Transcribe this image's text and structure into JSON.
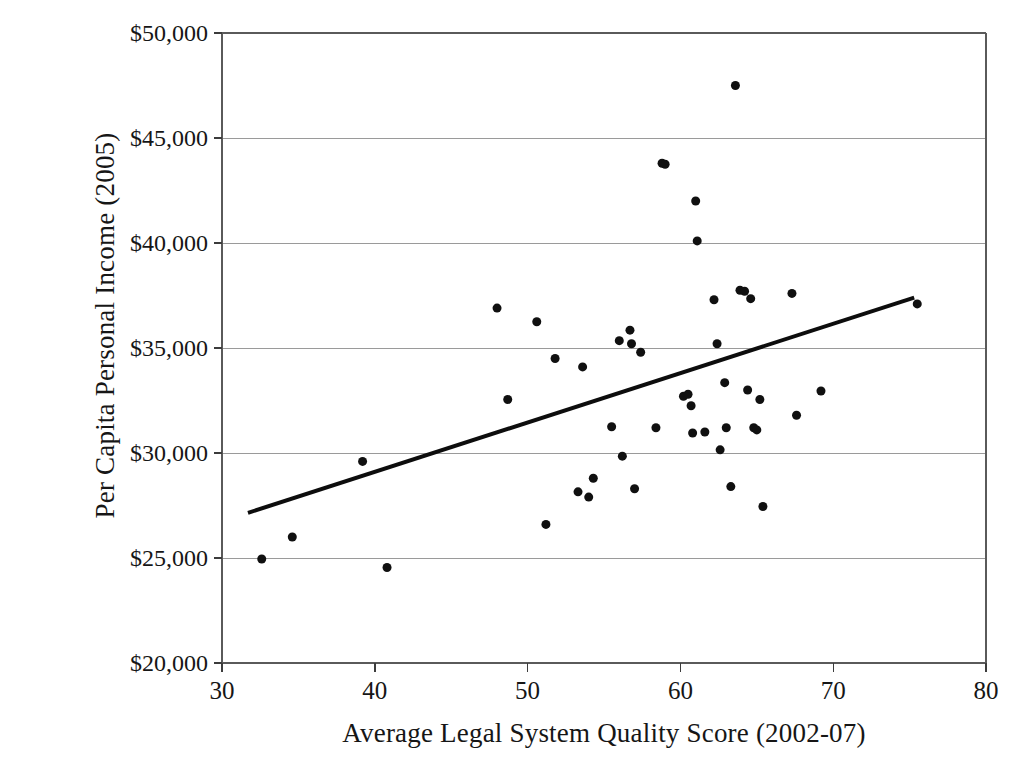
{
  "chart_data": {
    "type": "scatter",
    "title": "",
    "xlabel": "Average Legal System Quality Score (2002-07)",
    "ylabel": "Per Capita Personal Income (2005)",
    "xlim": [
      30,
      80
    ],
    "ylim": [
      20000,
      50000
    ],
    "xticks": [
      30,
      40,
      50,
      60,
      70,
      80
    ],
    "xtick_labels": [
      "30",
      "40",
      "50",
      "60",
      "70",
      "80"
    ],
    "yticks": [
      20000,
      25000,
      30000,
      35000,
      40000,
      45000,
      50000
    ],
    "ytick_labels": [
      "$20,000",
      "$25,000",
      "$30,000",
      "$35,000",
      "$40,000",
      "$45,000",
      "$50,000"
    ],
    "grid": "horizontal",
    "legend": "none",
    "marker": {
      "shape": "circle",
      "color": "#101010",
      "size": 9
    },
    "points": [
      {
        "x": 32.6,
        "y": 24950
      },
      {
        "x": 34.6,
        "y": 26000
      },
      {
        "x": 39.2,
        "y": 29600
      },
      {
        "x": 40.8,
        "y": 24550
      },
      {
        "x": 48.0,
        "y": 36900
      },
      {
        "x": 48.7,
        "y": 32550
      },
      {
        "x": 50.6,
        "y": 36250
      },
      {
        "x": 51.2,
        "y": 26600
      },
      {
        "x": 51.8,
        "y": 34500
      },
      {
        "x": 53.3,
        "y": 28150
      },
      {
        "x": 53.6,
        "y": 34100
      },
      {
        "x": 54.0,
        "y": 27900
      },
      {
        "x": 54.3,
        "y": 28800
      },
      {
        "x": 55.5,
        "y": 31250
      },
      {
        "x": 56.0,
        "y": 35350
      },
      {
        "x": 56.2,
        "y": 29850
      },
      {
        "x": 56.7,
        "y": 35850
      },
      {
        "x": 56.8,
        "y": 35200
      },
      {
        "x": 57.0,
        "y": 28300
      },
      {
        "x": 57.4,
        "y": 34800
      },
      {
        "x": 58.4,
        "y": 31200
      },
      {
        "x": 58.8,
        "y": 43800
      },
      {
        "x": 59.0,
        "y": 43750
      },
      {
        "x": 60.2,
        "y": 32700
      },
      {
        "x": 60.5,
        "y": 32800
      },
      {
        "x": 60.7,
        "y": 32250
      },
      {
        "x": 60.8,
        "y": 30950
      },
      {
        "x": 61.0,
        "y": 42000
      },
      {
        "x": 61.1,
        "y": 40100
      },
      {
        "x": 61.6,
        "y": 31000
      },
      {
        "x": 62.2,
        "y": 37300
      },
      {
        "x": 62.4,
        "y": 35200
      },
      {
        "x": 62.6,
        "y": 30150
      },
      {
        "x": 62.9,
        "y": 33350
      },
      {
        "x": 63.0,
        "y": 31200
      },
      {
        "x": 63.3,
        "y": 28400
      },
      {
        "x": 63.6,
        "y": 47500
      },
      {
        "x": 63.9,
        "y": 37750
      },
      {
        "x": 64.2,
        "y": 37700
      },
      {
        "x": 64.4,
        "y": 33000
      },
      {
        "x": 64.6,
        "y": 37350
      },
      {
        "x": 64.8,
        "y": 31200
      },
      {
        "x": 65.0,
        "y": 31100
      },
      {
        "x": 65.2,
        "y": 32550
      },
      {
        "x": 65.4,
        "y": 27450
      },
      {
        "x": 67.3,
        "y": 37600
      },
      {
        "x": 67.6,
        "y": 31800
      },
      {
        "x": 69.2,
        "y": 32950
      },
      {
        "x": 75.5,
        "y": 37100
      }
    ],
    "trendline": {
      "type": "linear",
      "x_start": 31.7,
      "y_start": 27150,
      "x_end": 75.3,
      "y_end": 37400,
      "color": "#0d0d0d",
      "width": 4
    }
  }
}
